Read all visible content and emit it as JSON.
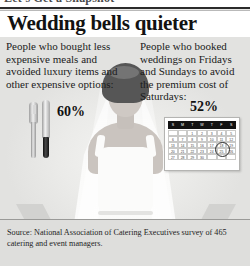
{
  "top_cropped_line": "Let's Get a Snapshot",
  "headline": "Wedding bells quieter",
  "left_stat": {
    "description": "People who bought less expensive meals and avoided luxury items and other expensive options:",
    "value": "60%",
    "icon": "fork-and-knife-icon"
  },
  "right_stat": {
    "description": "People who booked weddings on Fridays and Sundays to avoid the premium cost of Saturdays:",
    "value": "52%",
    "icon": "calendar-icon"
  },
  "calendar": {
    "weekday_headers": [
      "S",
      "M",
      "T",
      "W",
      "T",
      "F",
      "S"
    ],
    "weeks": [
      [
        "",
        "",
        "1",
        "2",
        "3",
        "4",
        "5"
      ],
      [
        "6",
        "7",
        "8",
        "9",
        "10",
        "11",
        "12"
      ],
      [
        "13",
        "14",
        "15",
        "16",
        "17",
        "18",
        "19"
      ],
      [
        "20",
        "21",
        "22",
        "23",
        "24",
        "25",
        "26"
      ],
      [
        "27",
        "28",
        "29",
        "30",
        "",
        "",
        ""
      ]
    ],
    "circled_day": "25"
  },
  "illustration": "bride-with-veil-photo",
  "source": "Source: National Association of Catering Executives survey of 465 catering and event managers.",
  "colors": {
    "headline": "#121212",
    "panel_bg": "#e7e7e5",
    "source_bg": "#dededc",
    "calendar_header": "#121212"
  }
}
